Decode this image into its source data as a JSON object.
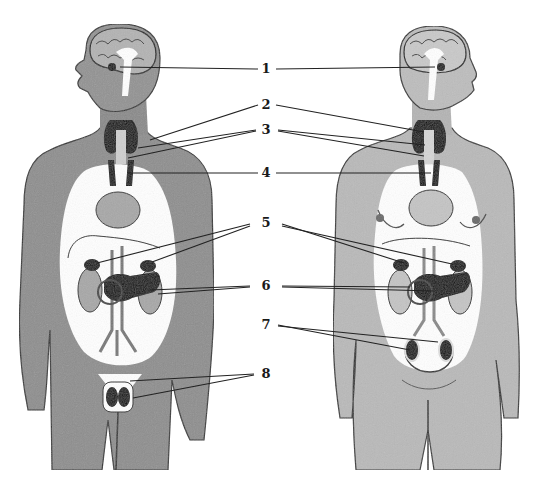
{
  "diagram": {
    "type": "anatomical-illustration",
    "colors": {
      "background": "#ffffff",
      "skin_male": "#8e8e8e",
      "skin_female": "#b9b9b9",
      "cavity": "#ffffff",
      "gland": "#111111",
      "organ_light": "#a7a7a7",
      "leader_line": "#222222"
    },
    "figures": [
      {
        "id": "male",
        "position": "left",
        "facing": "left"
      },
      {
        "id": "female",
        "position": "right",
        "facing": "right"
      }
    ],
    "labels": [
      {
        "number": "1",
        "x": 266,
        "y": 69,
        "targets_male": [
          [
            120,
            67
          ]
        ],
        "targets_female": [
          [
            435,
            67
          ]
        ]
      },
      {
        "number": "2",
        "x": 266,
        "y": 105,
        "targets_male": [
          [
            150,
            140
          ]
        ],
        "targets_female": [
          [
            424,
            132
          ]
        ]
      },
      {
        "number": "3",
        "x": 266,
        "y": 130,
        "targets_male": [
          [
            138,
            148
          ],
          [
            128,
            158
          ]
        ],
        "targets_female": [
          [
            425,
            145
          ],
          [
            424,
            156
          ]
        ]
      },
      {
        "number": "4",
        "x": 266,
        "y": 173,
        "targets_male": [
          [
            128,
            173
          ]
        ],
        "targets_female": [
          [
            431,
            173
          ]
        ]
      },
      {
        "number": "5",
        "x": 266,
        "y": 223,
        "targets_male": [
          [
            97,
            263
          ],
          [
            152,
            262
          ]
        ],
        "targets_female": [
          [
            404,
            263
          ],
          [
            452,
            264
          ]
        ]
      },
      {
        "number": "6",
        "x": 266,
        "y": 286,
        "targets_male": [
          [
            150,
            290
          ],
          [
            158,
            294
          ]
        ],
        "targets_female": [
          [
            410,
            287
          ],
          [
            433,
            291
          ]
        ]
      },
      {
        "number": "7",
        "x": 266,
        "y": 325,
        "targets_female": [
          [
            410,
            350
          ],
          [
            438,
            342
          ]
        ]
      },
      {
        "number": "8",
        "x": 266,
        "y": 374,
        "targets_male": [
          [
            130,
            381
          ],
          [
            133,
            398
          ]
        ]
      }
    ]
  }
}
